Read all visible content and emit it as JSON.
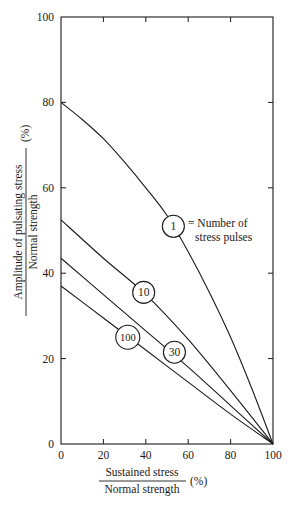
{
  "chart_data": {
    "type": "line",
    "title": "",
    "xlabel": {
      "numerator": "Sustained stress",
      "denominator": "Normal strength",
      "unit": "(%)"
    },
    "ylabel": {
      "numerator": "Amplitude of pulsating stress",
      "denominator": "Normal strength",
      "unit": "(%)"
    },
    "xlim": [
      0,
      100
    ],
    "ylim": [
      0,
      100
    ],
    "x_ticks": [
      0,
      20,
      40,
      60,
      80,
      100
    ],
    "y_ticks": [
      0,
      20,
      40,
      60,
      80,
      100
    ],
    "grid": false,
    "legend": {
      "text_line1": "= Number of",
      "text_line2": "stress pulses",
      "attached_to_series": "1"
    },
    "series": [
      {
        "name": "1",
        "label_position": {
          "x": 53,
          "y": 51
        },
        "x": [
          0,
          10,
          20,
          30,
          40,
          50,
          60,
          70,
          80,
          90,
          100
        ],
        "y": [
          80,
          76,
          71.5,
          66,
          60,
          53.5,
          45,
          35.5,
          25,
          13,
          0
        ]
      },
      {
        "name": "10",
        "label_position": {
          "x": 39,
          "y": 35.5
        },
        "x": [
          0,
          20,
          40,
          60,
          80,
          100
        ],
        "y": [
          52.5,
          43.5,
          35,
          24.5,
          12.5,
          0
        ]
      },
      {
        "name": "30",
        "label_position": {
          "x": 53.5,
          "y": 21.5
        },
        "x": [
          0,
          20,
          40,
          60,
          80,
          100
        ],
        "y": [
          43.5,
          35,
          26.5,
          18,
          9,
          0
        ]
      },
      {
        "name": "100",
        "label_position": {
          "x": 31.5,
          "y": 25
        },
        "x": [
          0,
          20,
          40,
          60,
          80,
          100
        ],
        "y": [
          37,
          29.5,
          22,
          14.5,
          7,
          0
        ]
      }
    ]
  }
}
